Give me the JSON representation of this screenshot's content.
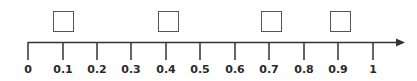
{
  "number_line": {
    "min": 0,
    "max": 1,
    "step": 0.1,
    "has_arrow": true,
    "line_color": "#333333",
    "box_color": "#555555",
    "ticks": [
      {
        "value": 0,
        "label": "0",
        "x": 28
      },
      {
        "value": 0.1,
        "label": "0.1",
        "x": 63
      },
      {
        "value": 0.2,
        "label": "0.2",
        "x": 97
      },
      {
        "value": 0.3,
        "label": "0.3",
        "x": 131
      },
      {
        "value": 0.4,
        "label": "0.4",
        "x": 166
      },
      {
        "value": 0.5,
        "label": "0.5",
        "x": 200
      },
      {
        "value": 0.6,
        "label": "0.6",
        "x": 235
      },
      {
        "value": 0.7,
        "label": "0.7",
        "x": 269
      },
      {
        "value": 0.8,
        "label": "0.8",
        "x": 304
      },
      {
        "value": 0.9,
        "label": "0.9",
        "x": 338
      },
      {
        "value": 1,
        "label": "1",
        "x": 373
      }
    ],
    "answer_boxes": [
      {
        "above_value": 0.1,
        "x": 53,
        "content": ""
      },
      {
        "above_value": 0.4,
        "x": 158,
        "content": ""
      },
      {
        "above_value": 0.7,
        "x": 261,
        "content": ""
      },
      {
        "above_value": 0.9,
        "x": 330,
        "content": ""
      }
    ]
  }
}
